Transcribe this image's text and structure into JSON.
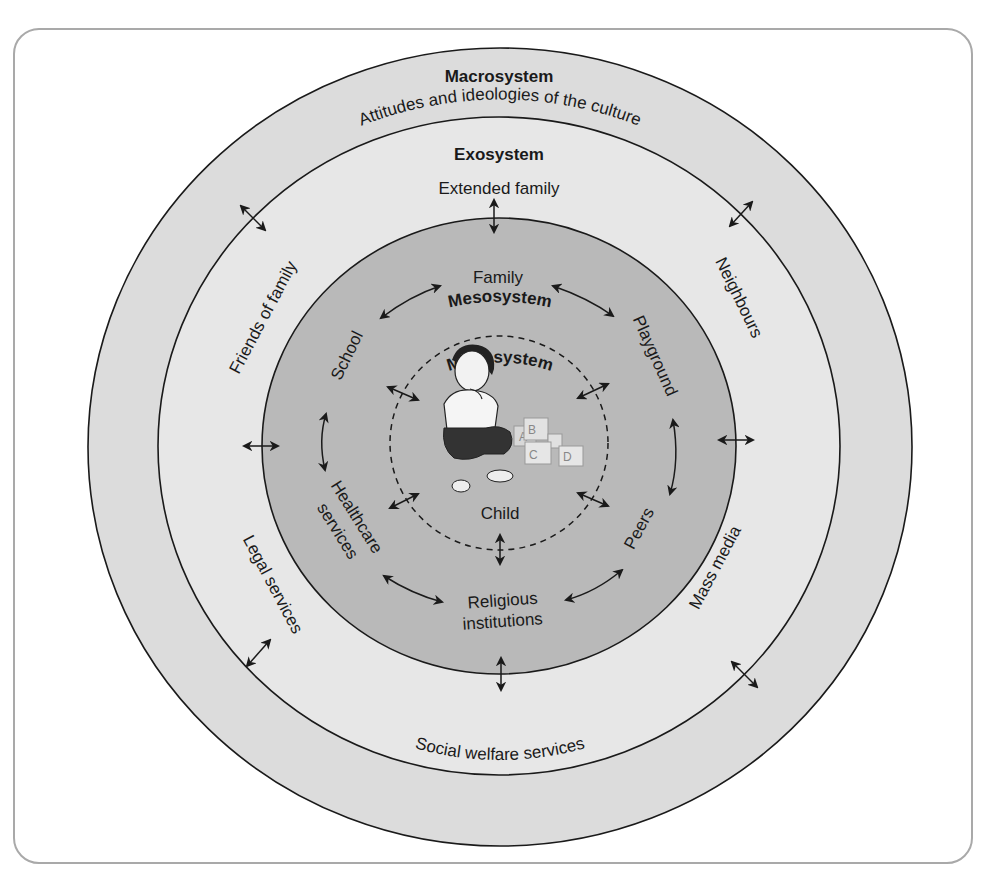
{
  "diagram": {
    "colors": {
      "macrosystem_fill": "#dcdcdc",
      "exosystem_fill": "#e7e7e7",
      "mesosystem_fill": "#b9b9b9",
      "microsystem_fill": "#b9b9b9",
      "line": "#1a1a1a",
      "frame_border": "#a9a9a9"
    },
    "layers": {
      "macrosystem": {
        "title": "Macrosystem",
        "items": [
          "Attitudes and ideologies of the culture"
        ]
      },
      "exosystem": {
        "title": "Exosystem",
        "items": [
          "Extended family",
          "Neighbours",
          "Mass media",
          "Social welfare services",
          "Legal services",
          "Friends of family"
        ]
      },
      "mesosystem": {
        "title": "Mesosystem",
        "items": [
          "Family",
          "Playground",
          "Peers",
          "Religious institutions",
          "Healthcare services",
          "School"
        ]
      },
      "microsystem": {
        "title": "Microsystem",
        "center_label": "Child",
        "blocks": [
          "A",
          "B",
          "C",
          "D"
        ]
      }
    },
    "labels": {
      "macro_title": "Macrosystem",
      "macro_item": "Attitudes and ideologies of the culture",
      "exo_title": "Exosystem",
      "extended_family": "Extended family",
      "neighbours": "Neighbours",
      "mass_media": "Mass media",
      "social_welfare": "Social welfare services",
      "legal_services": "Legal services",
      "friends_of_family": "Friends of family",
      "meso_title": "Mesosystem",
      "family": "Family",
      "playground": "Playground",
      "peers": "Peers",
      "religious_1": "Religious",
      "religious_2": "institutions",
      "healthcare_1": "Healthcare",
      "healthcare_2": "services",
      "school": "School",
      "micro_title": "Microsystem",
      "child": "Child",
      "block_a": "A",
      "block_b": "B",
      "block_c": "C",
      "block_d": "D"
    },
    "arrow_icons": "double-headed-arrow"
  }
}
